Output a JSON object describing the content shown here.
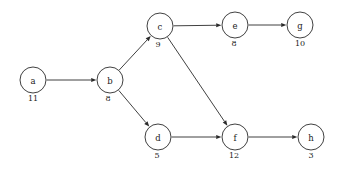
{
  "diagram": {
    "type": "directed-acyclic-graph",
    "title": "",
    "background_color": "#ffffff",
    "stroke_color": "#2b2b2b",
    "node_fill_color": "#ffffff",
    "node_radius": 13,
    "canvas": {
      "width": 342,
      "height": 173
    },
    "nodes": [
      {
        "id": "a",
        "label": "a",
        "weight": "11",
        "cx": 33,
        "cy": 80,
        "weight_x": 33,
        "weight_y": 101
      },
      {
        "id": "b",
        "label": "b",
        "weight": "8",
        "cx": 110,
        "cy": 80,
        "weight_x": 108,
        "weight_y": 101
      },
      {
        "id": "c",
        "label": "c",
        "weight": "9",
        "cx": 160,
        "cy": 26,
        "weight_x": 158,
        "weight_y": 47
      },
      {
        "id": "d",
        "label": "d",
        "weight": "5",
        "cx": 158,
        "cy": 137,
        "weight_x": 157,
        "weight_y": 158
      },
      {
        "id": "e",
        "label": "e",
        "weight": "8",
        "cx": 235,
        "cy": 25,
        "weight_x": 234,
        "weight_y": 46
      },
      {
        "id": "f",
        "label": "f",
        "weight": "12",
        "cx": 235,
        "cy": 137,
        "weight_x": 234,
        "weight_y": 158
      },
      {
        "id": "g",
        "label": "g",
        "weight": "10",
        "cx": 300,
        "cy": 25,
        "weight_x": 300,
        "weight_y": 46
      },
      {
        "id": "h",
        "label": "h",
        "weight": "3",
        "cx": 311,
        "cy": 137,
        "weight_x": 311,
        "weight_y": 158
      }
    ],
    "edges": [
      {
        "id": "a-b",
        "from": "a",
        "to": "b",
        "directed": true
      },
      {
        "id": "b-c",
        "from": "b",
        "to": "c",
        "directed": true
      },
      {
        "id": "b-d",
        "from": "b",
        "to": "d",
        "directed": true
      },
      {
        "id": "c-e",
        "from": "c",
        "to": "e",
        "directed": true
      },
      {
        "id": "c-f",
        "from": "c",
        "to": "f",
        "directed": true
      },
      {
        "id": "d-f",
        "from": "d",
        "to": "f",
        "directed": true
      },
      {
        "id": "e-g",
        "from": "e",
        "to": "g",
        "directed": true
      },
      {
        "id": "f-h",
        "from": "f",
        "to": "h",
        "directed": true
      }
    ]
  }
}
